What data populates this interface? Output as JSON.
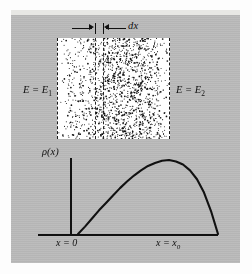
{
  "figure": {
    "name": "particle-density-diagram",
    "background_color": "#b9b9b9",
    "panel_color": "#ffffff",
    "ink_color": "#111111"
  },
  "stipple_box": {
    "label_left": "E = E",
    "label_left_sub": "1",
    "label_right": "E = E",
    "label_right_sub": "2",
    "dx_label": "dx",
    "dot_count": 1500,
    "border_style": "dashed"
  },
  "chart_data": {
    "type": "line",
    "title": "",
    "ylabel": "ρ(x)",
    "xlabel": "",
    "x_tick_labels": [
      "x = 0",
      "x = x"
    ],
    "x_tick_sub": [
      "",
      "0"
    ],
    "xlim": [
      0,
      1
    ],
    "ylim": [
      0,
      1
    ],
    "grid": false,
    "legend": "none",
    "x": [
      0.0,
      0.05,
      0.1,
      0.15,
      0.2,
      0.25,
      0.3,
      0.35,
      0.4,
      0.45,
      0.5,
      0.55,
      0.6,
      0.65,
      0.7,
      0.75,
      0.8,
      0.85,
      0.9,
      0.95,
      1.0
    ],
    "y": [
      0.0,
      0.1,
      0.21,
      0.32,
      0.42,
      0.52,
      0.62,
      0.71,
      0.79,
      0.86,
      0.92,
      0.96,
      0.99,
      1.0,
      0.98,
      0.94,
      0.86,
      0.74,
      0.56,
      0.31,
      0.0
    ]
  },
  "labels": {
    "rho": "ρ(x)",
    "x_zero": "x = 0",
    "x_max_prefix": "x = x",
    "x_max_sub": "0"
  }
}
